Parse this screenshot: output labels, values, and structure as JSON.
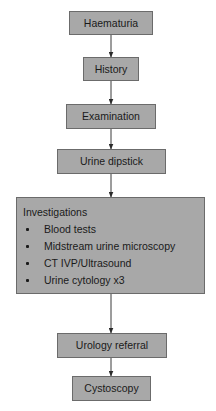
{
  "diagram": {
    "type": "flowchart",
    "direction": "top-to-bottom",
    "colors": {
      "box_fill": "#a8a8a8",
      "box_border": "#6b6b6b",
      "connector": "#3a3a3a",
      "text": "#1a1a1a",
      "background": "#ffffff"
    },
    "nodes": [
      {
        "id": "haematuria",
        "label": "Haematuria"
      },
      {
        "id": "history",
        "label": "History"
      },
      {
        "id": "examination",
        "label": "Examination"
      },
      {
        "id": "urine_dipstick",
        "label": "Urine dipstick"
      },
      {
        "id": "investigations",
        "label": "Investigations",
        "items": [
          "Blood tests",
          "Midstream urine microscopy",
          "CT IVP/Ultrasound",
          "Urine cytology x3"
        ]
      },
      {
        "id": "urology_referral",
        "label": "Urology referral"
      },
      {
        "id": "cystoscopy",
        "label": "Cystoscopy"
      }
    ],
    "edges": [
      {
        "from": "haematuria",
        "to": "history"
      },
      {
        "from": "history",
        "to": "examination"
      },
      {
        "from": "examination",
        "to": "urine_dipstick"
      },
      {
        "from": "urine_dipstick",
        "to": "investigations"
      },
      {
        "from": "investigations",
        "to": "urology_referral"
      },
      {
        "from": "urology_referral",
        "to": "cystoscopy"
      }
    ]
  }
}
